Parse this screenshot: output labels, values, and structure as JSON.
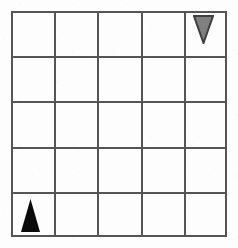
{
  "scene": {
    "title": "5x5 Grid with Two Triangle Tokens",
    "canvas": {
      "width": 238,
      "height": 248
    },
    "background_color": "#fdfdfd"
  },
  "grid": {
    "name": "grid-board",
    "rows": 5,
    "columns": 5,
    "left": 11,
    "top": 11,
    "right": 227,
    "bottom": 237,
    "cell_width": 43.2,
    "cell_height": 45.2,
    "line_color": "#555555",
    "line_width": 2,
    "row_labels": [
      "1",
      "2",
      "3",
      "4",
      "5"
    ],
    "column_labels": [
      "1",
      "2",
      "3",
      "4",
      "5"
    ]
  },
  "tokens": [
    {
      "id": "token-gray-down",
      "name": "gray-down-triangle-token",
      "shape": "triangle",
      "orientation": "down",
      "fill_color": "#808080",
      "stroke_color": "#3f3f3f",
      "stroke_width": 2,
      "row": 1,
      "column": 5,
      "cell_label": "r1c5",
      "width": 21,
      "height": 29,
      "left": 193,
      "top": 15
    },
    {
      "id": "token-black-up",
      "name": "black-up-triangle-token",
      "shape": "triangle",
      "orientation": "up",
      "fill_color": "#0a0a0a",
      "stroke_color": "#0a0a0a",
      "stroke_width": 0,
      "row": 5,
      "column": 1,
      "cell_label": "r5c1",
      "width": 19,
      "height": 33,
      "left": 21,
      "top": 199
    }
  ],
  "cells": [
    {
      "row": 1,
      "column": 1,
      "label": "r1c1",
      "occupant": ""
    },
    {
      "row": 1,
      "column": 2,
      "label": "r1c2",
      "occupant": ""
    },
    {
      "row": 1,
      "column": 3,
      "label": "r1c3",
      "occupant": ""
    },
    {
      "row": 1,
      "column": 4,
      "label": "r1c4",
      "occupant": ""
    },
    {
      "row": 1,
      "column": 5,
      "label": "r1c5",
      "occupant": "token-gray-down"
    },
    {
      "row": 2,
      "column": 1,
      "label": "r2c1",
      "occupant": ""
    },
    {
      "row": 2,
      "column": 2,
      "label": "r2c2",
      "occupant": ""
    },
    {
      "row": 2,
      "column": 3,
      "label": "r2c3",
      "occupant": ""
    },
    {
      "row": 2,
      "column": 4,
      "label": "r2c4",
      "occupant": ""
    },
    {
      "row": 2,
      "column": 5,
      "label": "r2c5",
      "occupant": ""
    },
    {
      "row": 3,
      "column": 1,
      "label": "r3c1",
      "occupant": ""
    },
    {
      "row": 3,
      "column": 2,
      "label": "r3c2",
      "occupant": ""
    },
    {
      "row": 3,
      "column": 3,
      "label": "r3c3",
      "occupant": ""
    },
    {
      "row": 3,
      "column": 4,
      "label": "r3c4",
      "occupant": ""
    },
    {
      "row": 3,
      "column": 5,
      "label": "r3c5",
      "occupant": ""
    },
    {
      "row": 4,
      "column": 1,
      "label": "r4c1",
      "occupant": ""
    },
    {
      "row": 4,
      "column": 2,
      "label": "r4c2",
      "occupant": ""
    },
    {
      "row": 4,
      "column": 3,
      "label": "r4c3",
      "occupant": ""
    },
    {
      "row": 4,
      "column": 4,
      "label": "r4c4",
      "occupant": ""
    },
    {
      "row": 4,
      "column": 5,
      "label": "r4c5",
      "occupant": ""
    },
    {
      "row": 5,
      "column": 1,
      "label": "r5c1",
      "occupant": "token-black-up"
    },
    {
      "row": 5,
      "column": 2,
      "label": "r5c2",
      "occupant": ""
    },
    {
      "row": 5,
      "column": 3,
      "label": "r5c3",
      "occupant": ""
    },
    {
      "row": 5,
      "column": 4,
      "label": "r5c4",
      "occupant": ""
    },
    {
      "row": 5,
      "column": 5,
      "label": "r5c5",
      "occupant": ""
    }
  ]
}
